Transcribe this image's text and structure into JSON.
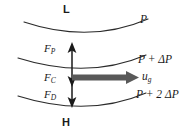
{
  "figure": {
    "pressure_labels": {
      "low_center": "L",
      "high_center": "H",
      "isobar_top": "P",
      "isobar_middle": "P + ΔP",
      "isobar_bottom": "P + 2 ΔP"
    },
    "wind_label": {
      "symbol": "u",
      "subscript": "g"
    },
    "forces": [
      {
        "id": "pressure-gradient-force",
        "symbol": "F",
        "subscript": "P",
        "direction": "up"
      },
      {
        "id": "coriolis-force",
        "symbol": "F",
        "subscript": "C",
        "direction": "down"
      },
      {
        "id": "friction-drag-force",
        "symbol": "F",
        "subscript": "D",
        "direction": "down"
      }
    ],
    "colors": {
      "line": "#2b2b2b",
      "arrow_dark": "#1a1a1a",
      "wind_arrow_gray": "#595959",
      "background": "#ffffff"
    }
  }
}
